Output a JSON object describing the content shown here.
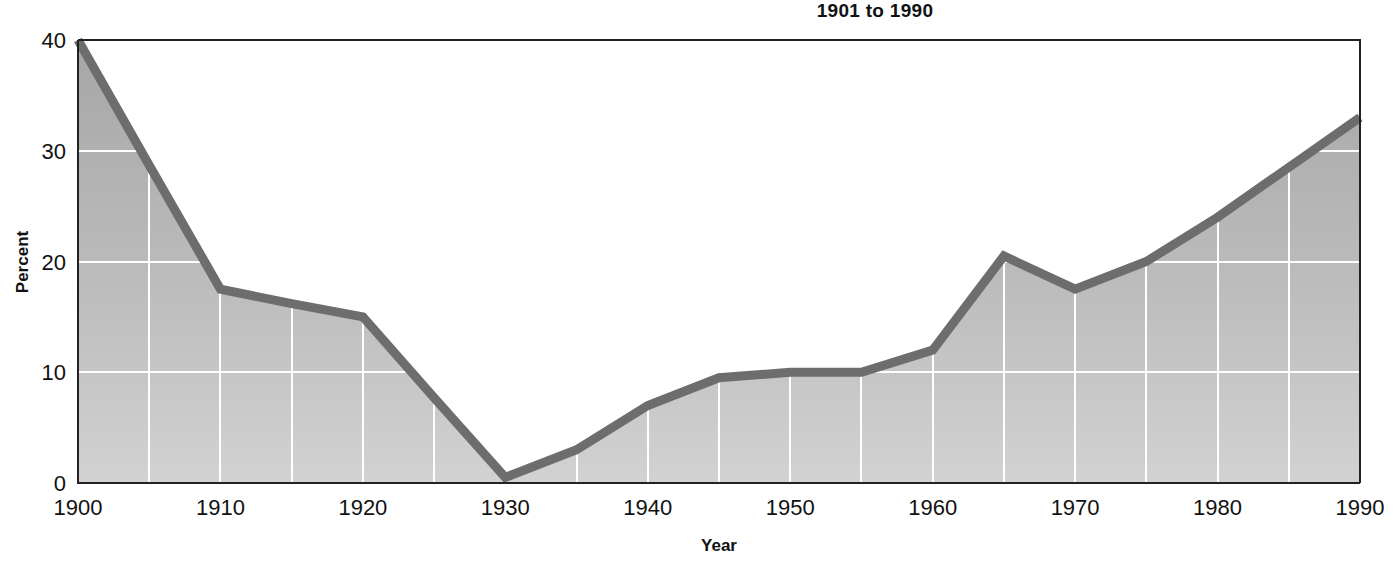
{
  "chart_data": {
    "type": "area",
    "title": "1901 to 1990",
    "subtitle": "",
    "xlabel": "Year",
    "ylabel": "Percent",
    "xlim": [
      1900,
      1990
    ],
    "ylim": [
      0,
      40
    ],
    "grid": true,
    "legend": "none",
    "x_tick_labels": [
      "1900",
      "1910",
      "1920",
      "1930",
      "1940",
      "1950",
      "1960",
      "1970",
      "1980",
      "1990"
    ],
    "x_ticks": [
      1900,
      1910,
      1920,
      1930,
      1940,
      1950,
      1960,
      1970,
      1980,
      1990
    ],
    "y_tick_labels": [
      "0",
      "10",
      "20",
      "30",
      "40"
    ],
    "y_ticks": [
      0,
      10,
      20,
      30,
      40
    ],
    "x_minor_gridline_interval": 5,
    "x": [
      1900,
      1905,
      1910,
      1915,
      1920,
      1925,
      1930,
      1935,
      1940,
      1945,
      1950,
      1955,
      1960,
      1965,
      1970,
      1975,
      1980,
      1985,
      1990
    ],
    "values": [
      40.0,
      28.7,
      17.5,
      16.2,
      15.0,
      7.7,
      0.5,
      3.0,
      7.0,
      9.5,
      10.0,
      10.0,
      12.0,
      20.5,
      17.5,
      20.0,
      24.0,
      28.5,
      33.0
    ],
    "series": [
      {
        "name": "Percent",
        "values": [
          40.0,
          28.7,
          17.5,
          16.2,
          15.0,
          7.7,
          0.5,
          3.0,
          7.0,
          9.5,
          10.0,
          10.0,
          12.0,
          20.5,
          17.5,
          20.0,
          24.0,
          28.5,
          33.0
        ]
      }
    ],
    "colors": {
      "line": "#6d6d6d",
      "fill_top": "#a8a8a8",
      "fill_bottom": "#cfcfcf",
      "gridline": "#ffffff",
      "axis": "#222222",
      "text": "#111111",
      "background": "#ffffff"
    }
  }
}
